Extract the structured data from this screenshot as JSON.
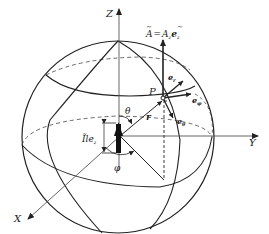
{
  "diagram": {
    "type": "spherical-coordinate-dipole",
    "axes": {
      "z_label": "Z",
      "y_label": "Y",
      "x_label": "X"
    },
    "point_label": "P",
    "vector_potential_label": "Ã = Ã_z e_z",
    "vector_potential": {
      "A": "A",
      "eq": "=",
      "Az": "A",
      "z_sub": "z",
      "e": "e",
      "ez_sub": "z"
    },
    "unit_vectors": {
      "er": {
        "base": "e",
        "sub": "r"
      },
      "ephi": {
        "base": "e",
        "sub": "φ"
      },
      "etheta": {
        "base": "e",
        "sub": "θ"
      }
    },
    "radius_label": "r",
    "theta_label": "θ",
    "phi_label": "φ",
    "dipole_label": {
      "text": "Ĩle",
      "sub": "z"
    },
    "colors": {
      "stroke": "#222222",
      "axis": "#555555",
      "background": "#ffffff"
    }
  }
}
